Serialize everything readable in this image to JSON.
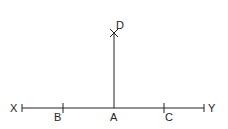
{
  "diagram": {
    "title": "",
    "line_color": "#222222",
    "background": "#ffffff",
    "labels": {
      "X": "X",
      "Y": "Y",
      "A": "A",
      "B": "B",
      "C": "C",
      "D": "D"
    },
    "points": {
      "X": {
        "x": 22,
        "y": 108
      },
      "Y": {
        "x": 204,
        "y": 108
      },
      "A": {
        "x": 114,
        "y": 108
      },
      "B": {
        "x": 63,
        "y": 108
      },
      "C": {
        "x": 164,
        "y": 108
      },
      "D": {
        "x": 114,
        "y": 33
      }
    },
    "segments": [
      {
        "from": "X",
        "to": "Y",
        "description": "horizontal line XY"
      },
      {
        "from": "A",
        "to": "D",
        "description": "perpendicular AD"
      }
    ]
  }
}
